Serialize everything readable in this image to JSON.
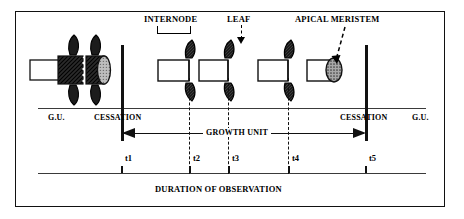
{
  "figure": {
    "type": "botanical-schematic",
    "title_text": "",
    "frame": {
      "border_color": "#111111"
    }
  },
  "callouts": {
    "internode": "INTERNODE",
    "leaf": "LEAF",
    "apical_meristem": "APICAL MERISTEM"
  },
  "axis_row": {
    "gu_left": "G.U.",
    "cessation_left": "CESSATION",
    "cessation_right": "CESSATION",
    "gu_right": "G.U."
  },
  "growth_unit": {
    "label": "GROWTH UNIT"
  },
  "timeline": {
    "caption": "DURATION OF OBSERVATION",
    "ticks": [
      {
        "id": "t1",
        "label": "t1",
        "x": 121
      },
      {
        "id": "t2",
        "label": "t2",
        "x": 189
      },
      {
        "id": "t3",
        "label": "t3",
        "x": 228
      },
      {
        "id": "t4",
        "label": "t4",
        "x": 288
      },
      {
        "id": "t5",
        "label": "t5",
        "x": 365
      }
    ]
  },
  "colors": {
    "ink": "#111111",
    "rule": "#3a3a3a",
    "leaf_dark": "#1a1a1a",
    "meristem_fill": "#9a9a9a",
    "hatch_dark": "#2b2b2b",
    "cap_fill": "#b5b5b5"
  },
  "structures": {
    "old_unit": {
      "name": "previous-growth-unit",
      "leaves": 4,
      "has_end_cap": true,
      "has_zigzag": true
    },
    "new_segments": [
      {
        "name": "segment-1",
        "leaves": 2
      },
      {
        "name": "segment-2",
        "leaves": 2
      },
      {
        "name": "segment-3",
        "leaves": 2
      },
      {
        "name": "segment-4-meristem",
        "leaves": 0,
        "has_meristem": true
      }
    ]
  }
}
